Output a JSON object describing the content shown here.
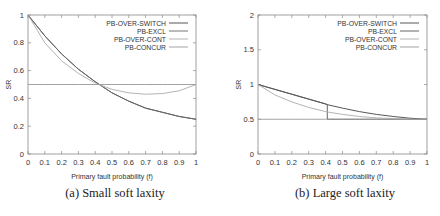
{
  "chart_data": [
    {
      "type": "line",
      "caption": "(a) Small soft laxity",
      "xlabel": "Primary fault probability (f)",
      "ylabel": "SR",
      "xlim": [
        0,
        1
      ],
      "ylim": [
        0,
        1
      ],
      "xticks": [
        "0",
        "0.1",
        "0.2",
        "0.3",
        "0.4",
        "0.5",
        "0.6",
        "0.7",
        "0.8",
        "0.9",
        "1"
      ],
      "yticks": [
        "0",
        "0.2",
        "0.4",
        "0.6",
        "0.8",
        "1"
      ],
      "legend_position": "top-right",
      "x": [
        0,
        0.1,
        0.2,
        0.3,
        0.4,
        0.5,
        0.6,
        0.7,
        0.8,
        0.9,
        1.0
      ],
      "series": [
        {
          "name": "PB-OVER-SWITCH",
          "color": "#444444",
          "values": [
            1.0,
            0.85,
            0.72,
            0.61,
            0.52,
            0.44,
            0.38,
            0.33,
            0.3,
            0.27,
            0.25
          ]
        },
        {
          "name": "PB-EXCL",
          "color": "#666666",
          "values": [
            1.0,
            0.85,
            0.72,
            0.61,
            0.52,
            0.44,
            0.38,
            0.33,
            0.3,
            0.27,
            0.25
          ]
        },
        {
          "name": "PB-OVER-CONT",
          "color": "#aaaaaa",
          "values": [
            1.0,
            0.8,
            0.67,
            0.58,
            0.51,
            0.465,
            0.44,
            0.43,
            0.435,
            0.455,
            0.5
          ]
        },
        {
          "name": "PB-CONCUR",
          "color": "#999999",
          "values": [
            0.5,
            0.5,
            0.5,
            0.5,
            0.5,
            0.5,
            0.5,
            0.5,
            0.5,
            0.5,
            0.5
          ]
        }
      ]
    },
    {
      "type": "line",
      "caption": "(b) Large soft laxity",
      "xlabel": "Primary fault probability (f)",
      "ylabel": "SR",
      "xlim": [
        0,
        1
      ],
      "ylim": [
        0,
        2
      ],
      "xticks": [
        "0",
        "0.1",
        "0.2",
        "0.3",
        "0.4",
        "0.5",
        "0.6",
        "0.7",
        "0.8",
        "0.9",
        "1"
      ],
      "yticks": [
        "0",
        "0.5",
        "1",
        "1.5",
        "2"
      ],
      "legend_position": "top-right",
      "x": [
        0,
        0.1,
        0.2,
        0.3,
        0.4,
        0.41,
        0.5,
        0.6,
        0.7,
        0.8,
        0.9,
        1.0
      ],
      "series": [
        {
          "name": "PB-OVER-SWITCH",
          "color": "#444444",
          "values": [
            1.0,
            0.93,
            0.86,
            0.79,
            0.72,
            0.71,
            0.66,
            0.61,
            0.57,
            0.54,
            0.515,
            0.5
          ]
        },
        {
          "name": "PB-EXCL",
          "color": "#555555",
          "values": [
            1.0,
            0.93,
            0.86,
            0.79,
            0.72,
            0.5,
            0.5,
            0.5,
            0.5,
            0.5,
            0.5,
            0.5
          ]
        },
        {
          "name": "PB-OVER-CONT",
          "color": "#aaaaaa",
          "values": [
            1.0,
            0.85,
            0.75,
            0.67,
            0.61,
            0.605,
            0.57,
            0.54,
            0.52,
            0.51,
            0.5,
            0.5
          ]
        },
        {
          "name": "PB-CONCUR",
          "color": "#999999",
          "values": [
            0.5,
            0.5,
            0.5,
            0.5,
            0.5,
            0.5,
            0.5,
            0.5,
            0.5,
            0.5,
            0.5,
            0.5
          ]
        }
      ]
    }
  ]
}
